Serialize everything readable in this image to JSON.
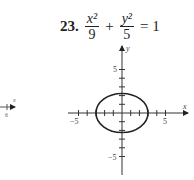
{
  "problem": {
    "number": "23.",
    "term1_num": "x²",
    "term1_den": "9",
    "plus": "+",
    "term2_num": "y²",
    "term2_den": "5",
    "equals": "= 1"
  },
  "graph": {
    "x_axis_label": "x",
    "y_axis_label": "y",
    "x_tick_neg": "−5",
    "x_tick_pos": "5",
    "y_tick_pos": "5",
    "y_tick_neg": "−5",
    "ellipse": {
      "a": 3,
      "b": 2.236
    }
  },
  "margin_fragment": {
    "label_top": "x",
    "label_bottom": "6"
  }
}
